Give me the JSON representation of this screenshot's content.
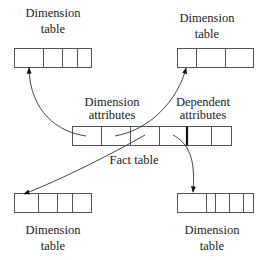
{
  "diagram": {
    "labels": {
      "top_left": [
        "Dimension",
        "table"
      ],
      "top_right": [
        "Dimension",
        "table"
      ],
      "dimension_attributes": [
        "Dimension",
        "attributes"
      ],
      "dependent_attributes": [
        "Dependent",
        "attributes"
      ],
      "fact_table": "Fact table",
      "bottom_left": [
        "Dimension",
        "table"
      ],
      "bottom_right": [
        "Dimension",
        "table"
      ]
    },
    "tables": [
      {
        "name": "dimension-table-top-left",
        "cells": 4
      },
      {
        "name": "dimension-table-top-right",
        "cells": 3
      },
      {
        "name": "fact-table",
        "cells": 6,
        "dimension_attribute_cells": 4,
        "dependent_attribute_cells": 2
      },
      {
        "name": "dimension-table-bottom-left",
        "cells": 4
      },
      {
        "name": "dimension-table-bottom-right",
        "cells": 5
      }
    ],
    "edges": [
      {
        "from": "fact-table.cell1",
        "to": "dimension-table-top-left"
      },
      {
        "from": "fact-table.cell2",
        "to": "dimension-table-top-right"
      },
      {
        "from": "fact-table.cell3",
        "to": "dimension-table-bottom-left"
      },
      {
        "from": "fact-table.cell4",
        "to": "dimension-table-bottom-right"
      }
    ]
  }
}
